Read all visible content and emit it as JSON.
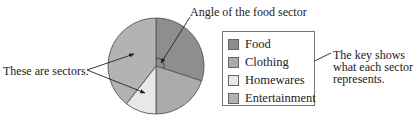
{
  "chart_data": {
    "type": "pie",
    "title": "",
    "start_angle_deg": 0,
    "direction": "clockwise",
    "slices": [
      {
        "label": "Food",
        "start_deg": 0,
        "end_deg": 108,
        "color": "#8e8e8e"
      },
      {
        "label": "Clothing",
        "start_deg": 108,
        "end_deg": 180,
        "color": "#ababab"
      },
      {
        "label": "Homewares",
        "start_deg": 180,
        "end_deg": 218,
        "color": "#e8e8e8"
      },
      {
        "label": "Entertainment",
        "start_deg": 218,
        "end_deg": 360,
        "color": "#b3b3b3"
      }
    ],
    "legend_position": "right",
    "annotations": [
      "Angle of the food sector",
      "These are sectors.",
      "The key shows what each sector represents."
    ]
  },
  "annotations": {
    "angle_label": "Angle of the food sector",
    "sectors_label": "These are sectors.",
    "key_note": [
      "The key shows",
      "what each sector",
      "represents."
    ]
  },
  "legend": {
    "items": [
      {
        "label": "Food",
        "color": "#8e8e8e"
      },
      {
        "label": "Clothing",
        "color": "#ababab"
      },
      {
        "label": "Homewares",
        "color": "#e8e8e8"
      },
      {
        "label": "Entertainment",
        "color": "#b3b3b3"
      }
    ]
  }
}
